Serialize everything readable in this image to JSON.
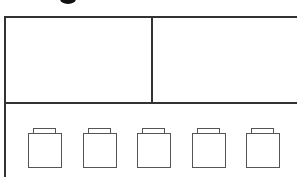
{
  "diagram": {
    "top_fragment": "g",
    "panels": [
      {
        "name": "top-left-panel"
      },
      {
        "name": "top-right-panel"
      },
      {
        "name": "bottom-panel"
      }
    ],
    "units": [
      {
        "index": 1,
        "x": 28
      },
      {
        "index": 2,
        "x": 83
      },
      {
        "index": 3,
        "x": 137
      },
      {
        "index": 4,
        "x": 192
      },
      {
        "index": 5,
        "x": 246
      }
    ],
    "colors": {
      "line": "#333333",
      "unit_stroke": "#555555",
      "background": "#ffffff"
    }
  }
}
